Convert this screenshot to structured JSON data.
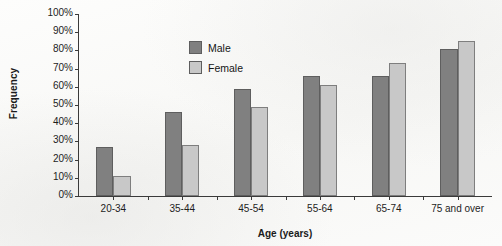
{
  "chart_data": {
    "type": "bar",
    "title": "",
    "xlabel": "Age (years)",
    "ylabel": "Frequency",
    "categories": [
      "20-34",
      "35-44",
      "45-54",
      "55-64",
      "65-74",
      "75 and over"
    ],
    "series": [
      {
        "name": "Male",
        "color": "#808080",
        "values": [
          27,
          46,
          59,
          66,
          66,
          81
        ]
      },
      {
        "name": "Female",
        "color": "#c8c8c8",
        "values": [
          11,
          28,
          49,
          61,
          73,
          85
        ]
      }
    ],
    "ylim": [
      0,
      100
    ],
    "ytick_values": [
      0,
      10,
      20,
      30,
      40,
      50,
      60,
      70,
      80,
      90,
      100
    ],
    "ytick_labels": [
      "0%",
      "10%",
      "20%",
      "30%",
      "40%",
      "50%",
      "60%",
      "70%",
      "80%",
      "90%",
      "100%"
    ],
    "grid": false,
    "legend_position": "upper left inside plot area"
  }
}
